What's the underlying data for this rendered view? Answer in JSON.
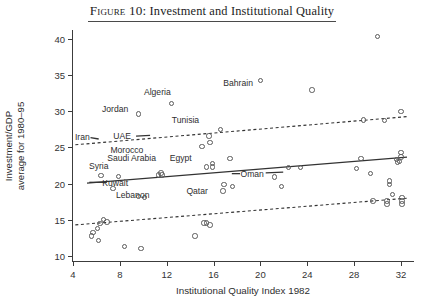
{
  "figure": {
    "title_prefix": "Figure 10:",
    "title_rest": " Investment and Institutional Quality",
    "title_full": "Figure 10: Investment and Institutional Quality"
  },
  "chart_data": {
    "type": "scatter",
    "title": "Figure 10: Investment and Institutional Quality",
    "xlabel": "Institutional Quality Index 1982",
    "ylabel": "Investment/GDP average for 1980–95",
    "ylabel_line1": "Investment/GDP",
    "ylabel_line2": "average for 1980–95",
    "xlim": [
      4,
      33.2
    ],
    "ylim": [
      9.2,
      41.2
    ],
    "xticks": [
      4,
      8,
      12,
      16,
      20,
      24,
      28,
      32
    ],
    "yticks": [
      10,
      15,
      20,
      25,
      30,
      35,
      40
    ],
    "grid": false,
    "legend": "none",
    "marker": "open-circle",
    "points": [
      {
        "x": 30.0,
        "y": 40.3
      },
      {
        "x": 20.0,
        "y": 34.2
      },
      {
        "x": 12.4,
        "y": 31.1
      },
      {
        "x": 24.4,
        "y": 32.9
      },
      {
        "x": 9.6,
        "y": 29.6
      },
      {
        "x": 32.0,
        "y": 30.0
      },
      {
        "x": 16.6,
        "y": 27.5
      },
      {
        "x": 28.8,
        "y": 28.8
      },
      {
        "x": 30.6,
        "y": 28.7
      },
      {
        "x": 15.6,
        "y": 26.6
      },
      {
        "x": 15.7,
        "y": 25.7
      },
      {
        "x": 15.0,
        "y": 25.1
      },
      {
        "x": 32.0,
        "y": 24.3
      },
      {
        "x": 32.0,
        "y": 23.7
      },
      {
        "x": 17.4,
        "y": 23.5
      },
      {
        "x": 15.9,
        "y": 22.8
      },
      {
        "x": 15.9,
        "y": 22.3
      },
      {
        "x": 15.4,
        "y": 22.3
      },
      {
        "x": 28.6,
        "y": 23.5
      },
      {
        "x": 31.6,
        "y": 23.3
      },
      {
        "x": 31.9,
        "y": 23.1
      },
      {
        "x": 31.7,
        "y": 23.0
      },
      {
        "x": 22.4,
        "y": 22.2
      },
      {
        "x": 23.4,
        "y": 22.2
      },
      {
        "x": 28.2,
        "y": 22.1
      },
      {
        "x": 29.4,
        "y": 21.4
      },
      {
        "x": 21.2,
        "y": 20.9
      },
      {
        "x": 6.4,
        "y": 21.1
      },
      {
        "x": 7.9,
        "y": 21.0
      },
      {
        "x": 11.3,
        "y": 21.2
      },
      {
        "x": 11.6,
        "y": 21.2
      },
      {
        "x": 11.5,
        "y": 21.5
      },
      {
        "x": 31.0,
        "y": 20.4
      },
      {
        "x": 31.0,
        "y": 19.9
      },
      {
        "x": 16.9,
        "y": 19.9
      },
      {
        "x": 17.6,
        "y": 19.6
      },
      {
        "x": 21.8,
        "y": 19.6
      },
      {
        "x": 16.8,
        "y": 19.0
      },
      {
        "x": 7.4,
        "y": 19.3
      },
      {
        "x": 9.6,
        "y": 18.2
      },
      {
        "x": 10.1,
        "y": 18.1
      },
      {
        "x": 31.3,
        "y": 18.5
      },
      {
        "x": 32.1,
        "y": 18.1
      },
      {
        "x": 29.6,
        "y": 17.6
      },
      {
        "x": 30.8,
        "y": 17.6
      },
      {
        "x": 30.8,
        "y": 17.2
      },
      {
        "x": 32.1,
        "y": 17.6
      },
      {
        "x": 32.1,
        "y": 17.2
      },
      {
        "x": 6.6,
        "y": 15.1
      },
      {
        "x": 6.9,
        "y": 14.7
      },
      {
        "x": 6.3,
        "y": 14.5
      },
      {
        "x": 15.2,
        "y": 14.6
      },
      {
        "x": 15.4,
        "y": 14.6
      },
      {
        "x": 15.7,
        "y": 14.3
      },
      {
        "x": 6.1,
        "y": 13.8
      },
      {
        "x": 5.7,
        "y": 13.3
      },
      {
        "x": 5.6,
        "y": 12.8
      },
      {
        "x": 6.2,
        "y": 12.2
      },
      {
        "x": 14.4,
        "y": 12.8
      },
      {
        "x": 8.4,
        "y": 11.3
      },
      {
        "x": 9.8,
        "y": 11.1
      }
    ],
    "annotations": [
      {
        "label": "Algeria",
        "x": 11.2,
        "y": 32.6
      },
      {
        "label": "Jordan",
        "x": 7.6,
        "y": 30.3
      },
      {
        "label": "Bahrain",
        "x": 18.1,
        "y": 33.9
      },
      {
        "label": "Tunisia",
        "x": 13.6,
        "y": 28.8
      },
      {
        "label": "Iran",
        "x": 4.8,
        "y": 26.4
      },
      {
        "label": "UAE",
        "x": 8.2,
        "y": 26.6
      },
      {
        "label": "Morocco",
        "x": 8.6,
        "y": 24.6
      },
      {
        "label": "Saudi Arabia",
        "x": 9.0,
        "y": 23.5
      },
      {
        "label": "Egypt",
        "x": 13.2,
        "y": 23.6
      },
      {
        "label": "Syria",
        "x": 6.2,
        "y": 22.5
      },
      {
        "label": "Kuwait",
        "x": 7.6,
        "y": 20.1
      },
      {
        "label": "Lebanon",
        "x": 9.1,
        "y": 18.5
      },
      {
        "label": "Oman",
        "x": 19.3,
        "y": 21.3
      },
      {
        "label": "Qatar",
        "x": 14.6,
        "y": 19.0
      }
    ],
    "lines": [
      {
        "name": "fit",
        "style": "solid",
        "x1": 5.2,
        "y1": 20.0,
        "x2": 32.6,
        "y2": 23.6
      },
      {
        "name": "upper-band",
        "style": "dashed",
        "x1": 4.2,
        "y1": 25.3,
        "x2": 32.6,
        "y2": 29.2
      },
      {
        "name": "lower-band",
        "style": "dashed",
        "x1": 4.2,
        "y1": 14.2,
        "x2": 32.6,
        "y2": 17.9
      }
    ],
    "leader_lines": [
      {
        "name": "kuwait-leader",
        "x1": 5.4,
        "y1": 20.1,
        "x2": 6.9,
        "y2": 20.1
      },
      {
        "name": "oman-leader",
        "x1": 17.6,
        "y1": 21.3,
        "x2": 18.3,
        "y2": 21.3
      },
      {
        "name": "oman-leader-right",
        "x1": 20.5,
        "y1": 21.4,
        "x2": 22.0,
        "y2": 21.5
      },
      {
        "name": "uae-leader",
        "x1": 9.4,
        "y1": 26.5,
        "x2": 10.6,
        "y2": 26.6
      },
      {
        "name": "iran-leader",
        "x1": 5.5,
        "y1": 26.3,
        "x2": 6.2,
        "y2": 26.1
      }
    ]
  }
}
